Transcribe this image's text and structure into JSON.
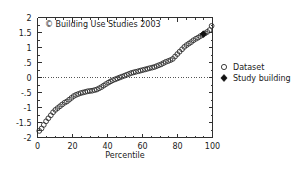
{
  "chart_data": {
    "type": "scatter",
    "title": "",
    "xlabel": "Percentile",
    "ylabel": "",
    "xlim": [
      0,
      100
    ],
    "ylim": [
      -2,
      2
    ],
    "grid": false,
    "zero_reference_line": 0,
    "xticks": [
      "0",
      "20",
      "40",
      "60",
      "80",
      "100"
    ],
    "xtick_values": [
      0,
      20,
      40,
      60,
      80,
      100
    ],
    "yticks": [
      "2",
      "1.5",
      "1",
      ".5",
      "0",
      "-.5",
      "-1",
      "-1.5",
      "-2"
    ],
    "ytick_values": [
      2,
      1.5,
      1,
      0.5,
      0,
      -0.5,
      -1,
      -1.5,
      -2
    ],
    "annotation": "© Building Use Studies 2003",
    "legend_position": "right",
    "series": [
      {
        "name": "Dataset",
        "marker": "open-circle",
        "x": [
          1.0,
          2.3,
          3.6,
          4.9,
          6.2,
          7.6,
          8.9,
          10.2,
          11.5,
          12.8,
          14.1,
          15.5,
          16.8,
          18.1,
          19.4,
          20.7,
          22.0,
          23.3,
          24.7,
          26.0,
          27.3,
          28.6,
          29.9,
          31.2,
          32.6,
          33.9,
          35.2,
          36.5,
          37.8,
          39.1,
          40.5,
          41.8,
          43.1,
          44.4,
          45.7,
          47.0,
          48.3,
          49.7,
          51.0,
          52.3,
          53.6,
          54.9,
          56.2,
          57.6,
          58.9,
          60.2,
          61.5,
          62.8,
          64.1,
          65.5,
          66.8,
          68.1,
          69.4,
          70.7,
          72.0,
          73.3,
          74.7,
          76.0,
          77.3,
          78.6,
          79.9,
          81.2,
          82.6,
          83.9,
          85.2,
          86.5,
          87.8,
          89.1,
          90.5,
          91.8,
          93.1,
          94.4,
          95.7,
          97.0,
          98.3,
          99.5
        ],
        "y": [
          -1.78,
          -1.7,
          -1.58,
          -1.46,
          -1.36,
          -1.26,
          -1.16,
          -1.08,
          -1.02,
          -0.96,
          -0.9,
          -0.84,
          -0.8,
          -0.74,
          -0.68,
          -0.62,
          -0.58,
          -0.55,
          -0.52,
          -0.5,
          -0.48,
          -0.46,
          -0.45,
          -0.44,
          -0.42,
          -0.4,
          -0.36,
          -0.32,
          -0.27,
          -0.22,
          -0.17,
          -0.13,
          -0.09,
          -0.06,
          -0.03,
          0.0,
          0.03,
          0.06,
          0.09,
          0.12,
          0.15,
          0.17,
          0.19,
          0.21,
          0.23,
          0.25,
          0.27,
          0.29,
          0.31,
          0.33,
          0.35,
          0.38,
          0.41,
          0.44,
          0.48,
          0.52,
          0.55,
          0.58,
          0.62,
          0.7,
          0.78,
          0.86,
          0.94,
          1.02,
          1.08,
          1.13,
          1.18,
          1.24,
          1.29,
          1.33,
          1.38,
          1.42,
          1.47,
          1.52,
          1.58,
          1.72
        ]
      },
      {
        "name": "Study building",
        "marker": "filled-diamond",
        "x": [
          94.8
        ],
        "y": [
          1.45
        ]
      }
    ]
  },
  "legend": {
    "items": [
      {
        "label": "Dataset",
        "marker": "open-circle"
      },
      {
        "label": "Study building",
        "marker": "filled-diamond"
      }
    ]
  },
  "colors": {
    "marker_stroke": "#2b2b2b",
    "marker_fill": "#111111",
    "axis": "#303030",
    "background": "#ffffff",
    "text": "#1a1a1a"
  }
}
